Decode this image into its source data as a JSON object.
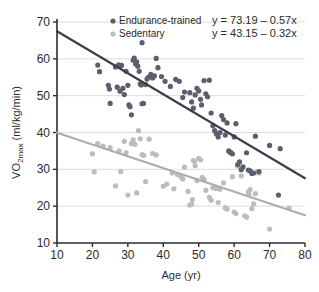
{
  "chart_data": {
    "type": "scatter",
    "title": "",
    "xlabel": "Age (yr)",
    "ylabel": "VO2max (ml/kg/min)",
    "ylabel_main": "VO",
    "ylabel_sub": "2max",
    "ylabel_rest": " (ml/kg/min)",
    "xlim": [
      10,
      80
    ],
    "ylim": [
      10,
      70
    ],
    "xticks": [
      10,
      20,
      30,
      40,
      50,
      60,
      70,
      80
    ],
    "yticks": [
      10,
      20,
      30,
      40,
      50,
      60,
      70
    ],
    "xtick_labels": [
      "10",
      "20",
      "30",
      "40",
      "50",
      "60",
      "70",
      "80"
    ],
    "ytick_labels": [
      "10",
      "20",
      "30",
      "40",
      "50",
      "60",
      "70"
    ],
    "grid": "horizontal",
    "legend_position": "top-center",
    "colors": {
      "endurance": "#5a5f6b",
      "sedentary": "#b9bcc1",
      "endurance_line": "#3a3f4a",
      "sedentary_line": "#a9acb2",
      "axis": "#2b2b2b",
      "grid": "#dddddd",
      "text": "#2b2b2b"
    },
    "series": [
      {
        "name": "Endurance-trained",
        "color": "#5a5f6b",
        "marker": "circle",
        "equation": "y = 73.19 – 0.57x",
        "fit": {
          "intercept": 73.19,
          "slope": -0.57,
          "x_start": 10,
          "x_end": 80,
          "y_start": 67.49,
          "y_end": 27.59
        },
        "points": [
          [
            21.5,
            58.3
          ],
          [
            22.0,
            56.5
          ],
          [
            24.5,
            52.8
          ],
          [
            24.8,
            51.8
          ],
          [
            25.0,
            47.9
          ],
          [
            26.5,
            57.8
          ],
          [
            27.0,
            52.3
          ],
          [
            27.4,
            58.4
          ],
          [
            27.8,
            51.2
          ],
          [
            28.2,
            58.2
          ],
          [
            28.6,
            52.0
          ],
          [
            29.0,
            50.3
          ],
          [
            29.5,
            56.6
          ],
          [
            30.0,
            52.8
          ],
          [
            30.3,
            47.5
          ],
          [
            30.6,
            47.0
          ],
          [
            31.0,
            44.8
          ],
          [
            31.5,
            59.6
          ],
          [
            31.8,
            60.2
          ],
          [
            32.2,
            58.6
          ],
          [
            32.5,
            59.2
          ],
          [
            32.8,
            58.0
          ],
          [
            33.2,
            56.6
          ],
          [
            33.5,
            53.2
          ],
          [
            33.8,
            52.9
          ],
          [
            34.0,
            47.8
          ],
          [
            34.4,
            47.9
          ],
          [
            35.0,
            53.0
          ],
          [
            35.4,
            54.5
          ],
          [
            35.8,
            55.0
          ],
          [
            36.5,
            55.8
          ],
          [
            37.0,
            54.8
          ],
          [
            37.5,
            55.4
          ],
          [
            38.0,
            60.1
          ],
          [
            38.5,
            57.6
          ],
          [
            39.5,
            55.2
          ],
          [
            40.5,
            53.9
          ],
          [
            42.0,
            52.5
          ],
          [
            43.5,
            54.4
          ],
          [
            44.5,
            53.9
          ],
          [
            45.5,
            49.5
          ],
          [
            46.0,
            51.0
          ],
          [
            47.5,
            50.8
          ],
          [
            48.0,
            48.3
          ],
          [
            48.5,
            46.6
          ],
          [
            49.0,
            50.2
          ],
          [
            49.5,
            52.0
          ],
          [
            50.0,
            51.3
          ],
          [
            50.5,
            49.0
          ],
          [
            50.8,
            47.5
          ],
          [
            51.5,
            54.1
          ],
          [
            52.0,
            50.5
          ],
          [
            52.5,
            49.7
          ],
          [
            53.0,
            54.2
          ],
          [
            53.5,
            45.3
          ],
          [
            54.0,
            41.8
          ],
          [
            54.5,
            40.5
          ],
          [
            55.0,
            39.6
          ],
          [
            55.5,
            38.8
          ],
          [
            56.0,
            40.0
          ],
          [
            56.5,
            44.6
          ],
          [
            57.0,
            43.5
          ],
          [
            57.5,
            39.3
          ],
          [
            58.0,
            42.6
          ],
          [
            58.5,
            35.0
          ],
          [
            59.0,
            34.6
          ],
          [
            59.5,
            34.2
          ],
          [
            60.0,
            38.8
          ],
          [
            60.5,
            42.4
          ],
          [
            61.0,
            31.3
          ],
          [
            61.5,
            32.0
          ],
          [
            62.0,
            29.9
          ],
          [
            62.5,
            30.7
          ],
          [
            63.5,
            34.5
          ],
          [
            64.0,
            29.8
          ],
          [
            64.5,
            29.6
          ],
          [
            65.0,
            28.9
          ],
          [
            65.5,
            29.0
          ],
          [
            66.0,
            39.0
          ],
          [
            67.0,
            29.4
          ],
          [
            70.0,
            36.5
          ],
          [
            72.5,
            23.0
          ],
          [
            73.0,
            35.6
          ],
          [
            34.0,
            64.4
          ]
        ]
      },
      {
        "name": "Sedentary",
        "color": "#b9bcc1",
        "marker": "circle",
        "equation": "y = 43.15 – 0.32x",
        "fit": {
          "intercept": 43.15,
          "slope": -0.32,
          "x_start": 10,
          "x_end": 80,
          "y_start": 39.95,
          "y_end": 17.55
        },
        "points": [
          [
            20.0,
            34.2
          ],
          [
            20.5,
            29.3
          ],
          [
            21.5,
            37.0
          ],
          [
            23.0,
            36.3
          ],
          [
            25.0,
            35.9
          ],
          [
            26.5,
            25.5
          ],
          [
            27.5,
            35.0
          ],
          [
            28.0,
            29.4
          ],
          [
            29.0,
            37.6
          ],
          [
            29.5,
            34.5
          ],
          [
            30.0,
            23.0
          ],
          [
            31.0,
            37.0
          ],
          [
            31.5,
            38.0
          ],
          [
            32.0,
            36.8
          ],
          [
            32.5,
            23.6
          ],
          [
            33.0,
            40.5
          ],
          [
            33.5,
            38.3
          ],
          [
            34.0,
            34.0
          ],
          [
            34.5,
            33.8
          ],
          [
            35.0,
            26.7
          ],
          [
            36.0,
            38.2
          ],
          [
            37.0,
            34.3
          ],
          [
            38.0,
            33.9
          ],
          [
            40.0,
            25.4
          ],
          [
            41.0,
            26.0
          ],
          [
            42.5,
            29.0
          ],
          [
            43.0,
            24.7
          ],
          [
            44.0,
            28.6
          ],
          [
            45.0,
            28.0
          ],
          [
            45.5,
            27.4
          ],
          [
            46.0,
            30.6
          ],
          [
            47.0,
            24.0
          ],
          [
            47.5,
            20.3
          ],
          [
            48.0,
            20.5
          ],
          [
            48.2,
            21.8
          ],
          [
            48.5,
            32.4
          ],
          [
            48.8,
            32.2
          ],
          [
            49.0,
            31.0
          ],
          [
            49.5,
            27.0
          ],
          [
            50.0,
            33.0
          ],
          [
            50.5,
            32.6
          ],
          [
            51.0,
            27.8
          ],
          [
            51.5,
            27.3
          ],
          [
            52.0,
            24.3
          ],
          [
            53.0,
            22.4
          ],
          [
            53.5,
            21.6
          ],
          [
            54.0,
            25.0
          ],
          [
            55.0,
            24.8
          ],
          [
            55.5,
            21.0
          ],
          [
            56.0,
            24.6
          ],
          [
            57.0,
            26.3
          ],
          [
            57.5,
            19.6
          ],
          [
            58.0,
            19.2
          ],
          [
            58.5,
            34.8
          ],
          [
            59.0,
            34.5
          ],
          [
            59.5,
            28.0
          ],
          [
            60.0,
            18.4
          ],
          [
            60.5,
            18.0
          ],
          [
            61.0,
            30.9
          ],
          [
            62.0,
            28.2
          ],
          [
            63.0,
            17.4
          ],
          [
            63.5,
            17.0
          ],
          [
            64.0,
            23.9
          ],
          [
            64.2,
            23.3
          ],
          [
            64.5,
            24.5
          ],
          [
            65.0,
            19.3
          ],
          [
            65.5,
            20.6
          ],
          [
            66.0,
            23.4
          ],
          [
            66.5,
            29.2
          ],
          [
            67.0,
            29.0
          ],
          [
            70.0,
            13.8
          ],
          [
            75.5,
            19.5
          ]
        ]
      }
    ],
    "legend": [
      {
        "label": "Endurance-trained",
        "color": "#5a5f6b",
        "equation": "y = 73.19 – 0.57x"
      },
      {
        "label": "Sedentary",
        "color": "#b9bcc1",
        "equation": "y = 43.15 – 0.32x"
      }
    ]
  }
}
